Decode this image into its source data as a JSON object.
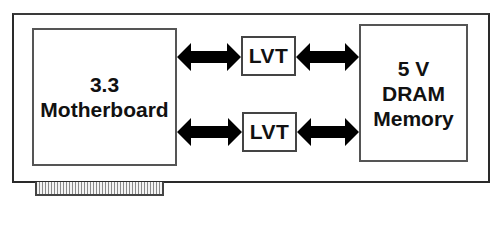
{
  "diagram": {
    "motherboard": {
      "line1": "3.3",
      "line2": "Motherboard"
    },
    "memory": {
      "line1": "5 V",
      "line2": "DRAM",
      "line3": "Memory"
    },
    "buffers": [
      {
        "label": "LVT"
      },
      {
        "label": "LVT"
      }
    ],
    "connections": [
      {
        "from": "Motherboard",
        "to": "LVT (top)",
        "type": "bidirectional"
      },
      {
        "from": "LVT (top)",
        "to": "DRAM Memory",
        "type": "bidirectional"
      },
      {
        "from": "Motherboard",
        "to": "LVT (bottom)",
        "type": "bidirectional"
      },
      {
        "from": "LVT (bottom)",
        "to": "DRAM Memory",
        "type": "bidirectional"
      }
    ],
    "colors": {
      "stroke": "#2a2a2a",
      "arrow": "#000000",
      "fill": "#ffffff",
      "connector_stripe": "#8a8a8a"
    }
  }
}
